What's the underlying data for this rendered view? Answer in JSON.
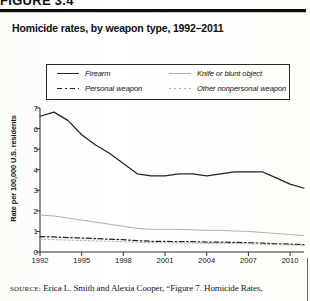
{
  "figure": {
    "header": "FIGURE 3.4",
    "title": "Homicide rates, by weapon type, 1992–2011"
  },
  "legend": {
    "items": [
      {
        "label": "Firearm",
        "style": "solid",
        "color": "#222222"
      },
      {
        "label": "Knife or blunt object",
        "style": "solid-light",
        "color": "#b3b1ad"
      },
      {
        "label": "Personal weapon",
        "style": "dash-dot",
        "color": "#222222"
      },
      {
        "label": "Other nonpersonal weapon",
        "style": "dotted-light",
        "color": "#b3b1ad"
      }
    ]
  },
  "source": {
    "prefix": "SOURCE:",
    "text": "Erica L. Smith and Alexia Cooper, “Figure 7. Homicide Rates,"
  },
  "chart_data": {
    "type": "line",
    "title": "Homicide rates, by weapon type, 1992–2011",
    "xlabel": "",
    "ylabel": "Rate per 100,000 U.S. residents",
    "xlim": [
      1992,
      2011
    ],
    "ylim": [
      0,
      7
    ],
    "yticks": [
      0,
      1,
      2,
      3,
      4,
      5,
      6,
      7
    ],
    "xticks": [
      1992,
      1995,
      1998,
      2001,
      2004,
      2007,
      2010
    ],
    "grid": false,
    "legend_position": "top-inside-box",
    "x": [
      1992,
      1993,
      1994,
      1995,
      1996,
      1997,
      1998,
      1999,
      2000,
      2001,
      2002,
      2003,
      2004,
      2005,
      2006,
      2007,
      2008,
      2009,
      2010,
      2011
    ],
    "series": [
      {
        "name": "Firearm",
        "color": "#222222",
        "style": "solid",
        "values": [
          6.6,
          6.8,
          6.4,
          5.7,
          5.2,
          4.8,
          4.3,
          3.8,
          3.7,
          3.7,
          3.8,
          3.8,
          3.7,
          3.8,
          3.9,
          3.9,
          3.9,
          3.6,
          3.3,
          3.1
        ]
      },
      {
        "name": "Knife or blunt object",
        "color": "#b3b1ad",
        "style": "solid-light",
        "values": [
          1.8,
          1.75,
          1.65,
          1.55,
          1.45,
          1.35,
          1.25,
          1.15,
          1.1,
          1.1,
          1.1,
          1.08,
          1.05,
          1.05,
          1.02,
          1.0,
          0.95,
          0.9,
          0.85,
          0.8
        ]
      },
      {
        "name": "Personal weapon",
        "color": "#222222",
        "style": "dash-dot",
        "values": [
          0.75,
          0.73,
          0.7,
          0.68,
          0.65,
          0.62,
          0.6,
          0.55,
          0.52,
          0.52,
          0.5,
          0.5,
          0.48,
          0.48,
          0.47,
          0.45,
          0.43,
          0.4,
          0.38,
          0.36
        ]
      },
      {
        "name": "Other nonpersonal weapon",
        "color": "#b3b1ad",
        "style": "dotted-light",
        "values": [
          0.62,
          0.6,
          0.58,
          0.56,
          0.54,
          0.52,
          0.5,
          0.47,
          0.45,
          0.45,
          0.44,
          0.43,
          0.42,
          0.42,
          0.41,
          0.4,
          0.38,
          0.36,
          0.34,
          0.33
        ]
      }
    ]
  }
}
